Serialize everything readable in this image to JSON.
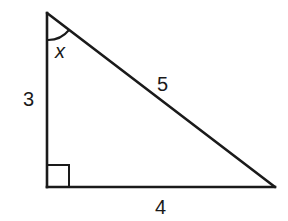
{
  "diagram": {
    "type": "right-triangle",
    "stroke_color": "#1a1a1a",
    "background": "#ffffff",
    "vertices": {
      "top": [
        47,
        13
      ],
      "right_angle": [
        47,
        187
      ],
      "bottom_right": [
        275,
        187
      ]
    },
    "labels": {
      "vertical_leg": "3",
      "hypotenuse": "5",
      "horizontal_leg": "4",
      "angle": "x"
    },
    "right_angle_marker": true,
    "angle_arc_at": "top"
  }
}
